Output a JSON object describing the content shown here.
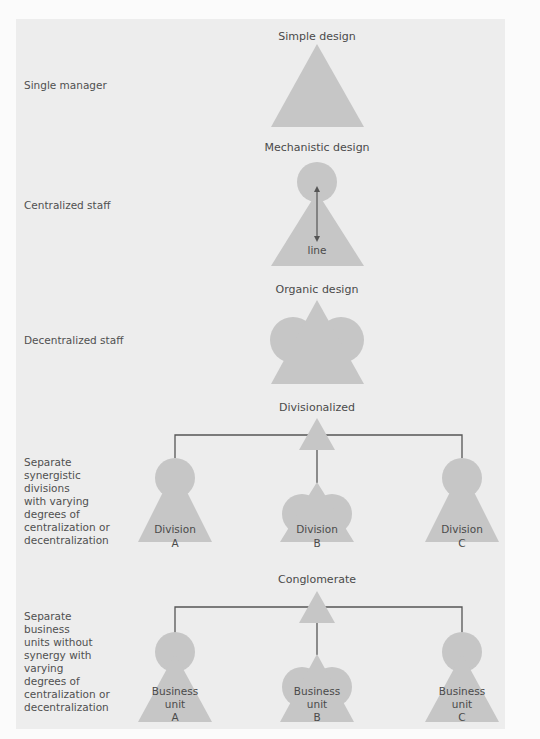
{
  "colors": {
    "panel": "#ededed",
    "shape": "#c6c6c6",
    "line": "#555555",
    "text": "#4a4a4a"
  },
  "rows": [
    {
      "id": "simple",
      "title": "Simple design",
      "description": "Single manager"
    },
    {
      "id": "mechanistic",
      "title": "Mechanistic design",
      "description": "Centralized staff",
      "arrow_label": "line"
    },
    {
      "id": "organic",
      "title": "Organic design",
      "description": "Decentralized staff"
    },
    {
      "id": "divisionalized",
      "title": "Divisionalized",
      "description": "Separate\nsynergistic\ndivisions\nwith varying\ndegrees of\ncentralization or\ndecentralization",
      "units": [
        {
          "line1": "Division",
          "line2": "A",
          "type": "mechanistic"
        },
        {
          "line1": "Division",
          "line2": "B",
          "type": "organic"
        },
        {
          "line1": "Division",
          "line2": "C",
          "type": "mechanistic"
        }
      ]
    },
    {
      "id": "conglomerate",
      "title": "Conglomerate",
      "description": "Separate\nbusiness\nunits without\nsynergy with\nvarying\ndegrees of\ncentralization or\ndecentralization",
      "units": [
        {
          "line1": "Business",
          "line2": "unit",
          "line3": "A",
          "type": "mechanistic"
        },
        {
          "line1": "Business",
          "line2": "unit",
          "line3": "B",
          "type": "organic"
        },
        {
          "line1": "Business",
          "line2": "unit",
          "line3": "C",
          "type": "mechanistic"
        }
      ]
    }
  ]
}
